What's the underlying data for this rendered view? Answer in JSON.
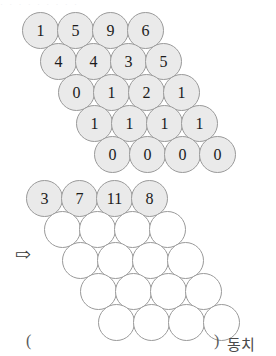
{
  "top_strip": {
    "text": "·  ·   ·  ·  ·   ·  ·    ·   ·"
  },
  "arrow": {
    "glyph": "⇨",
    "name": "implies-arrow"
  },
  "diagram_top": {
    "label": "filled-number-triangle",
    "rows": 5,
    "cols": 4,
    "origin_x": 22,
    "origin_y": 12,
    "col_step": 35,
    "row_step": 31,
    "row_indent": 18,
    "values": [
      [
        "1",
        "5",
        "9",
        "6"
      ],
      [
        "4",
        "4",
        "3",
        "5"
      ],
      [
        "0",
        "1",
        "2",
        "1"
      ],
      [
        "1",
        "1",
        "1",
        "1"
      ],
      [
        "0",
        "0",
        "0",
        "0"
      ]
    ],
    "fill_color": "#eaeaea",
    "stroke_color": "#9a9a9a"
  },
  "diagram_bottom": {
    "label": "blank-number-triangle",
    "rows": 5,
    "cols": 4,
    "origin_x": 26,
    "origin_y": 180,
    "col_step": 35,
    "row_step": 31,
    "row_indent": 18,
    "values": [
      [
        "3",
        "7",
        "11",
        "8"
      ],
      [
        "",
        "",
        "",
        ""
      ],
      [
        "",
        "",
        "",
        ""
      ],
      [
        "",
        "",
        "",
        ""
      ],
      [
        "",
        "",
        "",
        ""
      ]
    ],
    "filled_rows": [
      0
    ],
    "fill_color": "#eaeaea",
    "empty_color": "#ffffff",
    "stroke_color": "#9a9a9a"
  },
  "answer_line": {
    "paren_open": "(",
    "paren_close": ")",
    "word": "동치"
  }
}
